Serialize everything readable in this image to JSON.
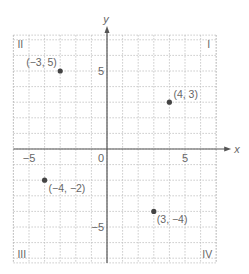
{
  "chart_data": {
    "type": "scatter",
    "title": "",
    "xlabel": "x",
    "ylabel": "y",
    "xlim": [
      -6,
      7
    ],
    "ylim": [
      -7.3,
      7.3
    ],
    "grid": true,
    "x_ticks": [
      {
        "value": -5,
        "label": "−5"
      },
      {
        "value": 0,
        "label": "0"
      },
      {
        "value": 5,
        "label": "5"
      }
    ],
    "y_ticks": [
      {
        "value": 5,
        "label": "5"
      },
      {
        "value": -5,
        "label": "−5"
      }
    ],
    "points": [
      {
        "x": -3,
        "y": 5,
        "label": "(−3, 5)"
      },
      {
        "x": 4,
        "y": 3,
        "label": "(4, 3)"
      },
      {
        "x": -4,
        "y": -2,
        "label": "(−4, −2)"
      },
      {
        "x": 3,
        "y": -4,
        "label": "(3, −4)"
      }
    ],
    "quadrant_labels": [
      {
        "name": "I",
        "label": "I"
      },
      {
        "name": "II",
        "label": "II"
      },
      {
        "name": "III",
        "label": "III"
      },
      {
        "name": "IV",
        "label": "IV"
      }
    ]
  },
  "colors": {
    "axis": "#555555",
    "grid": "#bdbdbd",
    "point": "#444444",
    "text": "#666666"
  }
}
